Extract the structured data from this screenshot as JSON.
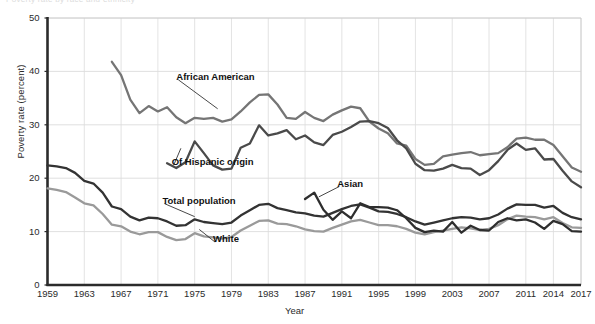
{
  "figure": {
    "cut_title": "Poverty rate by race and ethnicity",
    "ylabel": "Poverty rate (percent)",
    "xlabel": "Year"
  },
  "chart_data": {
    "type": "line",
    "title": "Poverty rate by race and ethnicity",
    "xlabel": "Year",
    "ylabel": "Poverty rate (percent)",
    "xlim": [
      1959,
      2017
    ],
    "ylim": [
      0,
      50
    ],
    "grid": true,
    "legend_position": "inline-annotations",
    "xticks": [
      1959,
      1963,
      1967,
      1971,
      1975,
      1979,
      1983,
      1987,
      1991,
      1995,
      1999,
      2003,
      2007,
      2011,
      2014,
      2017
    ],
    "yticks": [
      0,
      10,
      20,
      30,
      40,
      50
    ],
    "annotations": [
      {
        "text": "African American",
        "x": 1973,
        "y": 39.0,
        "leader_to_x": 1977.5,
        "leader_to_y": 33.0
      },
      {
        "text": "Of Hispanic origin",
        "x": 1972.5,
        "y": 23.0,
        "leader_to_x": 1973.5,
        "leader_to_y": 25.6
      },
      {
        "text": "Total population",
        "x": 1971.5,
        "y": 15.8,
        "leader_to_x": 1975.0,
        "leader_to_y": 12.8
      },
      {
        "text": "White",
        "x": 1977.0,
        "y": 8.6,
        "leader_to_x": 1975.5,
        "leader_to_y": 10.4
      },
      {
        "text": "Asian",
        "x": 1990.5,
        "y": 19.0,
        "leader_to_x": 1988.5,
        "leader_to_y": 16.5
      }
    ],
    "series": [
      {
        "name": "African American",
        "color": "#757575",
        "x": [
          1966,
          1967,
          1968,
          1969,
          1970,
          1971,
          1972,
          1973,
          1974,
          1975,
          1976,
          1977,
          1978,
          1979,
          1980,
          1981,
          1982,
          1983,
          1984,
          1985,
          1986,
          1987,
          1988,
          1989,
          1990,
          1991,
          1992,
          1993,
          1994,
          1995,
          1996,
          1997,
          1998,
          1999,
          2000,
          2001,
          2002,
          2003,
          2004,
          2005,
          2006,
          2007,
          2008,
          2009,
          2010,
          2011,
          2012,
          2013,
          2014,
          2015,
          2016,
          2017
        ],
        "values": [
          41.8,
          39.3,
          34.7,
          32.2,
          33.5,
          32.5,
          33.3,
          31.4,
          30.3,
          31.3,
          31.1,
          31.3,
          30.6,
          31.0,
          32.5,
          34.2,
          35.6,
          35.7,
          33.8,
          31.3,
          31.1,
          32.4,
          31.3,
          30.7,
          31.9,
          32.7,
          33.4,
          33.1,
          30.6,
          29.3,
          28.4,
          26.5,
          26.1,
          23.6,
          22.5,
          22.7,
          24.1,
          24.4,
          24.7,
          24.9,
          24.3,
          24.5,
          24.7,
          25.8,
          27.4,
          27.6,
          27.2,
          27.2,
          26.2,
          24.1,
          22.0,
          21.2
        ]
      },
      {
        "name": "Of Hispanic origin",
        "color": "#4a4a4a",
        "x": [
          1972,
          1973,
          1974,
          1975,
          1976,
          1977,
          1978,
          1979,
          1980,
          1981,
          1982,
          1983,
          1984,
          1985,
          1986,
          1987,
          1988,
          1989,
          1990,
          1991,
          1992,
          1993,
          1994,
          1995,
          1996,
          1997,
          1998,
          1999,
          2000,
          2001,
          2002,
          2003,
          2004,
          2005,
          2006,
          2007,
          2008,
          2009,
          2010,
          2011,
          2012,
          2013,
          2014,
          2015,
          2016,
          2017
        ],
        "values": [
          22.8,
          21.9,
          23.0,
          26.9,
          24.7,
          22.4,
          21.6,
          21.8,
          25.7,
          26.5,
          29.9,
          28.0,
          28.4,
          29.0,
          27.3,
          28.0,
          26.7,
          26.2,
          28.1,
          28.7,
          29.6,
          30.6,
          30.7,
          30.3,
          29.4,
          27.1,
          25.6,
          22.7,
          21.5,
          21.4,
          21.8,
          22.5,
          21.9,
          21.8,
          20.6,
          21.5,
          23.2,
          25.3,
          26.5,
          25.3,
          25.6,
          23.5,
          23.6,
          21.4,
          19.4,
          18.3
        ]
      },
      {
        "name": "Total population",
        "color": "#333333",
        "x": [
          1959,
          1960,
          1961,
          1962,
          1963,
          1964,
          1965,
          1966,
          1967,
          1968,
          1969,
          1970,
          1971,
          1972,
          1973,
          1974,
          1975,
          1976,
          1977,
          1978,
          1979,
          1980,
          1981,
          1982,
          1983,
          1984,
          1985,
          1986,
          1987,
          1988,
          1989,
          1990,
          1991,
          1992,
          1993,
          1994,
          1995,
          1996,
          1997,
          1998,
          1999,
          2000,
          2001,
          2002,
          2003,
          2004,
          2005,
          2006,
          2007,
          2008,
          2009,
          2010,
          2011,
          2012,
          2013,
          2014,
          2015,
          2016,
          2017
        ],
        "values": [
          22.4,
          22.2,
          21.9,
          21.0,
          19.5,
          19.0,
          17.3,
          14.7,
          14.2,
          12.8,
          12.1,
          12.6,
          12.5,
          11.9,
          11.1,
          11.2,
          12.3,
          11.8,
          11.6,
          11.4,
          11.7,
          13.0,
          14.0,
          15.0,
          15.2,
          14.4,
          14.0,
          13.6,
          13.4,
          13.0,
          12.8,
          13.5,
          14.2,
          14.8,
          15.1,
          14.5,
          13.8,
          13.7,
          13.3,
          12.7,
          11.9,
          11.3,
          11.7,
          12.1,
          12.5,
          12.7,
          12.6,
          12.3,
          12.5,
          13.2,
          14.3,
          15.1,
          15.0,
          15.0,
          14.5,
          14.8,
          13.5,
          12.7,
          12.3
        ]
      },
      {
        "name": "White",
        "color": "#9a9a9a",
        "x": [
          1959,
          1960,
          1961,
          1962,
          1963,
          1964,
          1965,
          1966,
          1967,
          1968,
          1969,
          1970,
          1971,
          1972,
          1973,
          1974,
          1975,
          1976,
          1977,
          1978,
          1979,
          1980,
          1981,
          1982,
          1983,
          1984,
          1985,
          1986,
          1987,
          1988,
          1989,
          1990,
          1991,
          1992,
          1993,
          1994,
          1995,
          1996,
          1997,
          1998,
          1999,
          2000,
          2001,
          2002,
          2003,
          2004,
          2005,
          2006,
          2007,
          2008,
          2009,
          2010,
          2011,
          2012,
          2013,
          2014,
          2015,
          2016,
          2017
        ],
        "values": [
          18.1,
          17.8,
          17.4,
          16.4,
          15.3,
          14.9,
          13.3,
          11.3,
          11.0,
          10.0,
          9.5,
          9.9,
          9.9,
          9.0,
          8.4,
          8.6,
          9.7,
          9.1,
          8.9,
          8.7,
          9.0,
          10.2,
          11.1,
          12.0,
          12.1,
          11.5,
          11.4,
          11.0,
          10.4,
          10.1,
          10.0,
          10.7,
          11.3,
          11.9,
          12.2,
          11.7,
          11.2,
          11.2,
          11.0,
          10.5,
          9.8,
          9.5,
          9.9,
          10.2,
          10.5,
          10.8,
          10.6,
          10.3,
          10.5,
          11.2,
          12.3,
          13.0,
          12.8,
          12.7,
          12.3,
          12.7,
          11.6,
          10.8,
          10.7
        ]
      },
      {
        "name": "Asian",
        "color": "#2e2e2e",
        "x": [
          1987,
          1988,
          1989,
          1990,
          1991,
          1992,
          1993,
          1994,
          1995,
          1996,
          1997,
          1998,
          1999,
          2000,
          2001,
          2002,
          2003,
          2004,
          2005,
          2006,
          2007,
          2008,
          2009,
          2010,
          2011,
          2012,
          2013,
          2014,
          2015,
          2016,
          2017
        ],
        "values": [
          16.1,
          17.3,
          14.1,
          12.2,
          13.8,
          12.5,
          15.3,
          14.6,
          14.6,
          14.5,
          14.0,
          12.5,
          10.7,
          9.9,
          10.2,
          10.0,
          11.8,
          9.8,
          11.1,
          10.3,
          10.2,
          11.8,
          12.5,
          12.1,
          12.3,
          11.7,
          10.5,
          12.0,
          11.4,
          10.1,
          10.0
        ]
      }
    ]
  }
}
